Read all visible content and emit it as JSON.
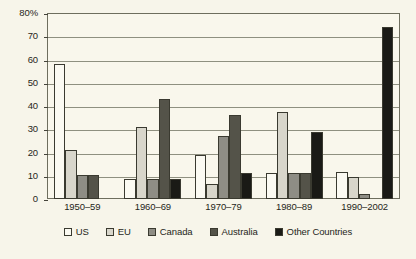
{
  "chart_data": {
    "type": "bar",
    "title": "",
    "xlabel": "",
    "ylabel": "",
    "ylim": [
      0,
      80
    ],
    "grid": true,
    "legend_position": "bottom",
    "categories": [
      "1950–59",
      "1960–69",
      "1970–79",
      "1980–89",
      "1990–2002"
    ],
    "y_ticks": [
      0,
      10,
      20,
      30,
      40,
      50,
      60,
      70,
      80
    ],
    "y_tick_labels": [
      "0",
      "10",
      "20",
      "30",
      "40",
      "50",
      "60",
      "70",
      "80%"
    ],
    "series": [
      {
        "name": "US",
        "color": "#fbfaf2",
        "values": [
          58,
          8.5,
          19,
          11,
          11.5
        ]
      },
      {
        "name": "EU",
        "color": "#d8d6cb",
        "values": [
          21,
          31,
          6.5,
          37.5,
          9.5
        ]
      },
      {
        "name": "Canada",
        "color": "#8e8d85",
        "values": [
          10.5,
          8.5,
          27,
          11,
          2
        ]
      },
      {
        "name": "Australia",
        "color": "#545349",
        "values": [
          10.5,
          43,
          36,
          11,
          0
        ]
      },
      {
        "name": "Other Countries",
        "color": "#1a1a16",
        "values": [
          0,
          8.5,
          11,
          29,
          74
        ]
      }
    ]
  }
}
